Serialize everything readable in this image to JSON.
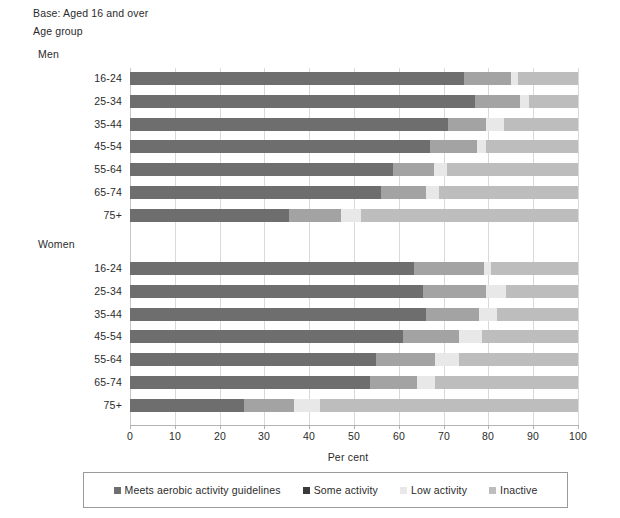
{
  "header": {
    "base_note": "Base: Aged 16 and over",
    "age_group_label": "Age group"
  },
  "axis": {
    "x_title": "Per cent",
    "ticks": [
      "0",
      "10",
      "20",
      "30",
      "40",
      "50",
      "60",
      "70",
      "80",
      "90",
      "100"
    ]
  },
  "groups": [
    {
      "name": "Men"
    },
    {
      "name": "Women"
    }
  ],
  "legend": {
    "items": [
      {
        "label": "Meets aerobic activity guidelines",
        "color": "#6e6e6e"
      },
      {
        "label": "Some activity",
        "color": "#3a3a3a"
      },
      {
        "label": "Low activity",
        "color": "#e8e8e8"
      },
      {
        "label": "Inactive",
        "color": "#bdbdbd"
      }
    ]
  },
  "chart_data": {
    "type": "bar",
    "orientation": "horizontal",
    "stacked": true,
    "title": "",
    "subtitle": "Base: Aged 16 and over",
    "xlabel": "Per cent",
    "ylabel": "Age group",
    "xlim": [
      0,
      100
    ],
    "grid": true,
    "legend_position": "bottom",
    "series": [
      {
        "name": "Meets aerobic activity guidelines",
        "color": "#6e6e6e"
      },
      {
        "name": "Some activity",
        "color": "#a3a3a3"
      },
      {
        "name": "Low activity",
        "color": "#e8e8e8"
      },
      {
        "name": "Inactive",
        "color": "#bdbdbd"
      }
    ],
    "groups": [
      {
        "name": "Men",
        "categories": [
          "16-24",
          "25-34",
          "35-44",
          "45-54",
          "55-64",
          "65-74",
          "75+"
        ],
        "values": [
          [
            74.5,
            10.5,
            1.5,
            13.5
          ],
          [
            77.0,
            10.0,
            2.0,
            11.0
          ],
          [
            71.0,
            8.5,
            4.0,
            16.5
          ],
          [
            67.0,
            10.5,
            2.0,
            20.5
          ],
          [
            58.8,
            9.0,
            3.0,
            29.2
          ],
          [
            56.0,
            10.0,
            3.0,
            31.0
          ],
          [
            35.5,
            11.5,
            4.5,
            48.5
          ]
        ]
      },
      {
        "name": "Women",
        "categories": [
          "16-24",
          "25-34",
          "35-44",
          "45-54",
          "55-64",
          "65-74",
          "75+"
        ],
        "values": [
          [
            63.3,
            15.7,
            1.5,
            19.5
          ],
          [
            65.5,
            14.0,
            4.5,
            16.0
          ],
          [
            66.0,
            12.0,
            4.0,
            18.0
          ],
          [
            61.0,
            12.5,
            5.0,
            21.5
          ],
          [
            55.0,
            13.0,
            5.5,
            26.5
          ],
          [
            53.5,
            10.5,
            4.0,
            32.0
          ],
          [
            25.5,
            11.0,
            6.0,
            57.5
          ]
        ]
      }
    ]
  }
}
